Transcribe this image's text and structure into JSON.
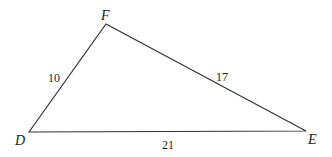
{
  "diagram": {
    "type": "triangle",
    "stroke_color": "#333333",
    "vertices": [
      {
        "name": "D",
        "x": 29,
        "y": 132,
        "label_x": 15,
        "label_y": 145
      },
      {
        "name": "F",
        "x": 106,
        "y": 24,
        "label_x": 101,
        "label_y": 20
      },
      {
        "name": "E",
        "x": 306,
        "y": 131,
        "label_x": 308,
        "label_y": 144
      }
    ],
    "sides": [
      {
        "name": "DF",
        "label": "10",
        "label_x": 48,
        "label_y": 82
      },
      {
        "name": "FE",
        "label": "17",
        "label_x": 216,
        "label_y": 81
      },
      {
        "name": "DE",
        "label": "21",
        "label_x": 162,
        "label_y": 149
      }
    ]
  }
}
